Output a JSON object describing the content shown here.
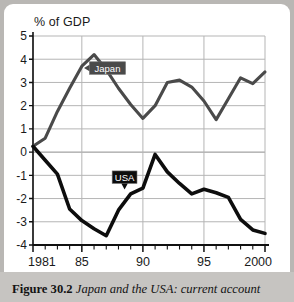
{
  "figure": {
    "caption_label": "Figure 30.2",
    "caption_text": "Japan and the USA: current account",
    "panel_bg": "#ffffff",
    "page_bg": "#b9b7b4"
  },
  "chart_data": {
    "type": "line",
    "title": "",
    "ylabel": "% of GDP",
    "xlabel": "",
    "ylim": [
      -4,
      5
    ],
    "xlim": [
      1981,
      2000
    ],
    "yticks": [
      5,
      4,
      3,
      2,
      1,
      0,
      -1,
      -2,
      -3,
      -4
    ],
    "ytick_labels": [
      "5",
      "4",
      "3",
      "2",
      "1",
      "0",
      "-1",
      "-2",
      "-3",
      "-4"
    ],
    "xticks": [
      1981,
      1985,
      1990,
      1995,
      2000
    ],
    "xtick_labels": [
      "1981",
      "85",
      "90",
      "95",
      "2000"
    ],
    "x": [
      1981,
      1982,
      1983,
      1984,
      1985,
      1986,
      1987,
      1988,
      1989,
      1990,
      1991,
      1992,
      1993,
      1994,
      1995,
      1996,
      1997,
      1998,
      1999,
      2000
    ],
    "grid": true,
    "legend_position": "inline-callouts",
    "series": [
      {
        "name": "Japan",
        "color": "#4a4a4a",
        "width": 3.1,
        "label_x": 1987.1,
        "label_y": 3.62,
        "arrow": "left",
        "values": [
          0.25,
          0.6,
          1.75,
          2.75,
          3.7,
          4.2,
          3.55,
          2.75,
          2.05,
          1.45,
          2.0,
          3.0,
          3.1,
          2.8,
          2.2,
          1.4,
          2.3,
          3.2,
          2.95,
          3.45
        ]
      },
      {
        "name": "USA",
        "color": "#0d0d0d",
        "width": 3.6,
        "label_x": 1988.5,
        "label_y": -1.08,
        "arrow": "down",
        "values": [
          0.25,
          -0.35,
          -0.95,
          -2.45,
          -2.95,
          -3.3,
          -3.6,
          -2.5,
          -1.8,
          -1.55,
          -0.1,
          -0.85,
          -1.35,
          -1.8,
          -1.6,
          -1.75,
          -1.95,
          -2.9,
          -3.35,
          -3.5
        ]
      }
    ]
  }
}
